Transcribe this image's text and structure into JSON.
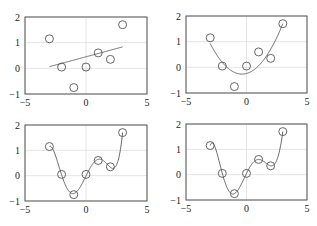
{
  "figure": {
    "width": 317,
    "height": 226,
    "layout": "2x2 subplots"
  },
  "chart_data": [
    {
      "type": "scatter+line",
      "title": "",
      "xlabel": "",
      "ylabel": "",
      "xlim": [
        -5,
        5
      ],
      "ylim": [
        -1,
        2
      ],
      "xticks": [
        "-5",
        "0",
        "5"
      ],
      "yticks": [
        "-1",
        "0",
        "1",
        "2"
      ],
      "grid": true,
      "points": {
        "x": [
          -3,
          -2,
          -1,
          0,
          1,
          2,
          3
        ],
        "y": [
          1.15,
          0.05,
          -0.75,
          0.05,
          0.6,
          0.35,
          1.7
        ]
      },
      "fit": {
        "kind": "polynomial",
        "degree": 1,
        "x_range": [
          -3,
          3
        ]
      },
      "box": {
        "left": 25,
        "top": 17,
        "right": 147,
        "bottom": 94
      }
    },
    {
      "type": "scatter+line",
      "title": "",
      "xlabel": "",
      "ylabel": "",
      "xlim": [
        -5,
        5
      ],
      "ylim": [
        -1,
        2
      ],
      "xticks": [
        "-5",
        "0",
        "5"
      ],
      "yticks": [
        "-1",
        "0",
        "1",
        "2"
      ],
      "grid": true,
      "points": {
        "x": [
          -3,
          -2,
          -1,
          0,
          1,
          2,
          3
        ],
        "y": [
          1.15,
          0.05,
          -0.75,
          0.05,
          0.6,
          0.35,
          1.7
        ]
      },
      "fit": {
        "kind": "polynomial",
        "degree": 2,
        "x_range": [
          -3,
          3
        ]
      },
      "box": {
        "left": 186,
        "top": 16,
        "right": 307,
        "bottom": 93
      }
    },
    {
      "type": "scatter+line",
      "title": "",
      "xlabel": "",
      "ylabel": "",
      "xlim": [
        -5,
        5
      ],
      "ylim": [
        -1,
        2
      ],
      "xticks": [
        "-5",
        "0",
        "5"
      ],
      "yticks": [
        "-1",
        "0",
        "1",
        "2"
      ],
      "grid": true,
      "points": {
        "x": [
          -3,
          -2,
          -1,
          0,
          1,
          2,
          3
        ],
        "y": [
          1.15,
          0.05,
          -0.75,
          0.05,
          0.6,
          0.35,
          1.7
        ]
      },
      "fit": {
        "kind": "polynomial",
        "degree": 5,
        "x_range": [
          -3,
          3
        ]
      },
      "box": {
        "left": 25,
        "top": 125,
        "right": 147,
        "bottom": 201
      }
    },
    {
      "type": "scatter+line",
      "title": "",
      "xlabel": "",
      "ylabel": "",
      "xlim": [
        -5,
        5
      ],
      "ylim": [
        -1,
        2
      ],
      "xticks": [
        "-5",
        "0",
        "5"
      ],
      "yticks": [
        "-1",
        "0",
        "1",
        "2"
      ],
      "grid": true,
      "points": {
        "x": [
          -3,
          -2,
          -1,
          0,
          1,
          2,
          3
        ],
        "y": [
          1.15,
          0.05,
          -0.75,
          0.05,
          0.6,
          0.35,
          1.7
        ]
      },
      "fit": {
        "kind": "polynomial",
        "degree": 6,
        "x_range": [
          -3,
          3
        ]
      },
      "box": {
        "left": 186,
        "top": 124,
        "right": 307,
        "bottom": 200
      }
    }
  ],
  "colors": {
    "axes": "#555555",
    "grid": "#dddddd",
    "line": "#555555",
    "marker": "#555555",
    "text": "#222222"
  }
}
